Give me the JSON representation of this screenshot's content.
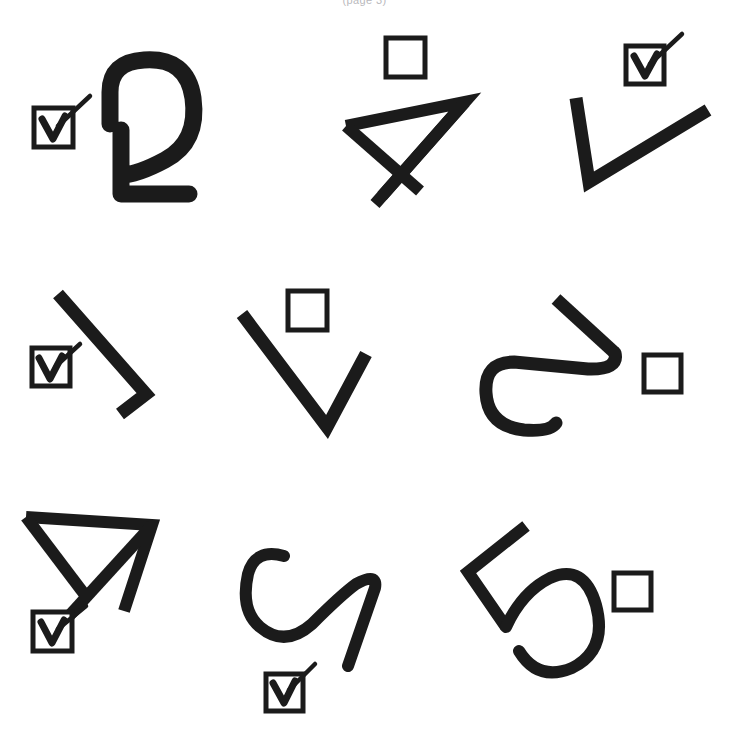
{
  "page": {
    "width": 729,
    "height": 744,
    "background_color": "#ffffff",
    "ink_color": "#1b1b1b",
    "header_caption": "(page 3)",
    "header_caption_color": "#b9b9bd"
  },
  "legend": {
    "checked_symbol": "checked-checkbox",
    "unchecked_symbol": "empty-checkbox"
  },
  "grid": {
    "rows": 3,
    "columns": 3,
    "total_items": 9,
    "checked_count": 5,
    "unchecked_count": 4
  },
  "items": [
    {
      "index": 1,
      "row": 1,
      "column": 1,
      "glyph_name": "rotated-loop-with-angular-tail",
      "glyph_description": "rounded open loop above an angular L-shaped tail",
      "checkbox_state": "checked",
      "checkbox_label": "checked",
      "checkbox_position": "left"
    },
    {
      "index": 2,
      "row": 1,
      "column": 2,
      "glyph_name": "triangle-with-crossed-tails",
      "glyph_description": "open triangle whose two long sides cross below into an X",
      "checkbox_state": "unchecked",
      "checkbox_label": "unchecked",
      "checkbox_position": "top"
    },
    {
      "index": 3,
      "row": 1,
      "column": 3,
      "glyph_name": "wide-open-vee",
      "glyph_description": "wide asymmetric V / check-mark stroke",
      "checkbox_state": "checked",
      "checkbox_label": "checked",
      "checkbox_position": "top"
    },
    {
      "index": 4,
      "row": 2,
      "column": 1,
      "glyph_name": "diagonal-stroke-with-hook",
      "glyph_description": "long diagonal stroke ending in a small hook at lower right",
      "checkbox_state": "checked",
      "checkbox_label": "checked",
      "checkbox_position": "left"
    },
    {
      "index": 5,
      "row": 2,
      "column": 2,
      "glyph_name": "narrow-vee",
      "glyph_description": "narrow downward pointing V",
      "checkbox_state": "unchecked",
      "checkbox_label": "unchecked",
      "checkbox_position": "top"
    },
    {
      "index": 6,
      "row": 2,
      "column": 3,
      "glyph_name": "rotated-s-curve",
      "glyph_description": "sideways S / hook curve with straight upper arm",
      "checkbox_state": "unchecked",
      "checkbox_label": "unchecked",
      "checkbox_position": "right"
    },
    {
      "index": 7,
      "row": 3,
      "column": 1,
      "glyph_name": "triangle-with-crossed-tails",
      "glyph_description": "open triangle whose two long sides cross below into an X",
      "checkbox_state": "checked",
      "checkbox_label": "checked",
      "checkbox_position": "bottom-left"
    },
    {
      "index": 8,
      "row": 3,
      "column": 2,
      "glyph_name": "s-curve-with-straight-tail",
      "glyph_description": "flowing S curve ending in a long straight descending tail",
      "checkbox_state": "checked",
      "checkbox_label": "checked",
      "checkbox_position": "bottom"
    },
    {
      "index": 9,
      "row": 3,
      "column": 3,
      "glyph_name": "five-like-loop",
      "glyph_description": "angular arm above a large round bowl, resembling a figure 5",
      "checkbox_state": "unchecked",
      "checkbox_label": "unchecked",
      "checkbox_position": "right"
    }
  ]
}
